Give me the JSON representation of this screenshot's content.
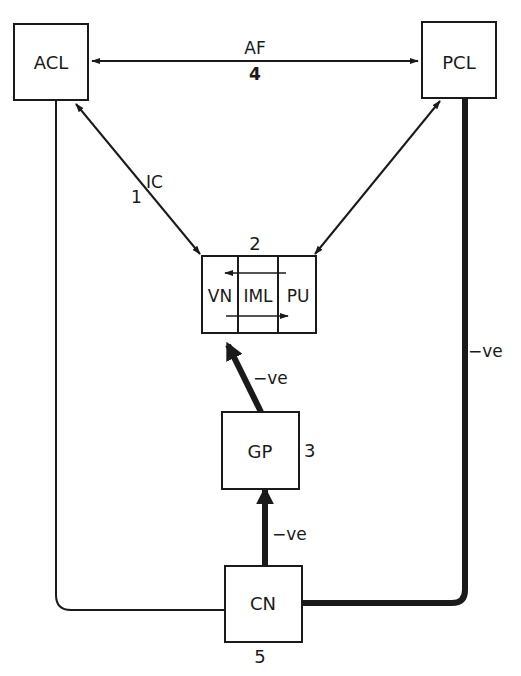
{
  "diagram": {
    "type": "block-flow",
    "nodes": {
      "acl": {
        "label": "ACL"
      },
      "pcl": {
        "label": "PCL"
      },
      "thalamus": {
        "number": "2",
        "segments": [
          "VN",
          "IML",
          "PU"
        ]
      },
      "gp": {
        "label": "GP",
        "number": "3"
      },
      "cn": {
        "label": "CN",
        "number": "5"
      }
    },
    "edges": {
      "af": {
        "label": "AF",
        "number": "4",
        "from": "ACL",
        "to": "PCL",
        "direction": "bidirectional"
      },
      "ic": {
        "label": "IC",
        "number": "1",
        "from": "ACL",
        "to": "thalamus",
        "direction": "bidirectional"
      },
      "pcl_thal": {
        "from": "PCL",
        "to": "thalamus",
        "direction": "bidirectional"
      },
      "gp_thal": {
        "label": "−ve",
        "from": "GP",
        "to": "VN",
        "style": "thick"
      },
      "cn_gp": {
        "label": "−ve",
        "from": "CN",
        "to": "GP",
        "style": "thick"
      },
      "pcl_cn": {
        "label": "−ve",
        "from": "PCL",
        "to": "CN",
        "style": "thick"
      },
      "acl_cn": {
        "from": "ACL",
        "to": "CN",
        "style": "thin"
      }
    }
  }
}
